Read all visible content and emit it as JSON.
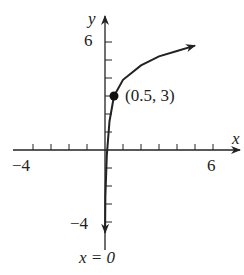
{
  "chart_data": {
    "type": "line",
    "title": "",
    "xlabel": "x",
    "ylabel": "y",
    "xlim": [
      -4,
      6
    ],
    "ylim": [
      -4,
      6
    ],
    "x_tick_labels": [
      "-4",
      "6"
    ],
    "y_tick_labels": [
      "6",
      "-4"
    ],
    "x_ticks": [
      -4,
      -3,
      -2,
      -1,
      1,
      2,
      3,
      4,
      5,
      6
    ],
    "y_ticks": [
      -4,
      -3,
      -2,
      -1,
      1,
      2,
      3,
      4,
      5,
      6
    ],
    "series": [
      {
        "name": "y = log curve with vertical asymptote x = 0",
        "x": [
          0.005,
          0.02,
          0.1,
          0.25,
          0.5,
          1,
          2,
          3,
          4,
          5
        ],
        "y": [
          -4.6,
          -2.6,
          -0.3,
          1.6,
          3,
          3.9,
          4.7,
          5.2,
          5.5,
          5.8
        ]
      }
    ],
    "points": [
      {
        "x": 0.5,
        "y": 3,
        "label": "(0.5, 3)"
      }
    ],
    "annotations": [
      {
        "text": "x = 0",
        "meaning": "vertical asymptote"
      }
    ],
    "grid": false
  },
  "labels": {
    "x_axis": "x",
    "y_axis": "y",
    "y_top": "6",
    "y_bottom": "−4",
    "x_left": "−4",
    "x_right": "6",
    "point": "(0.5, 3)",
    "asymptote": "x = 0"
  }
}
